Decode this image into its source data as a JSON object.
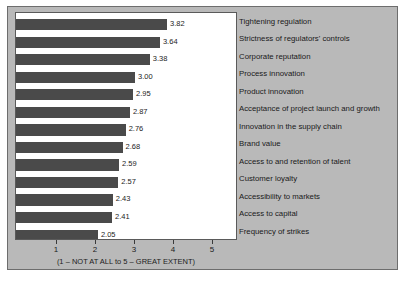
{
  "chart_data": {
    "type": "bar",
    "orientation": "horizontal",
    "title": "",
    "xlabel": "(1 – NOT AT ALL to 5 – GREAT EXTENT)",
    "ylabel": "",
    "xlim": [
      1,
      5
    ],
    "xticks": [
      "1",
      "2",
      "3",
      "4",
      "5"
    ],
    "grid": false,
    "legend": null,
    "categories": [
      "Tightening regulation",
      "Strictness of regulators' controls",
      "Corporate reputation",
      "Process innovation",
      "Product innovation",
      "Acceptance of project launch and growth",
      "Innovation in the supply chain",
      "Brand value",
      "Access to and retention of talent",
      "Customer loyalty",
      "Accessibility to markets",
      "Access to capital",
      "Frequency of strikes"
    ],
    "values": [
      3.82,
      3.64,
      3.38,
      3.0,
      2.95,
      2.87,
      2.76,
      2.68,
      2.59,
      2.57,
      2.43,
      2.41,
      2.05
    ],
    "value_labels": [
      "3.82",
      "3.64",
      "3.38",
      "3.00",
      "2.95",
      "2.87",
      "2.76",
      "2.68",
      "2.59",
      "2.57",
      "2.43",
      "2.41",
      "2.05"
    ],
    "colors": {
      "bar": "#4a4a4a",
      "plot_background": "#ffffff",
      "figure_background": "#b9b9b9",
      "border": "#5a5a5a",
      "text": "#1a1a1a"
    }
  }
}
